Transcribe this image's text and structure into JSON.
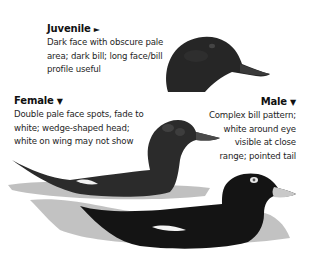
{
  "plate": {
    "captions": {
      "juvenile": {
        "title": "Juvenile",
        "arrow": "►",
        "lines": [
          "Dark face with obscure pale",
          "area; dark bill; long face/bill",
          "profile useful"
        ]
      },
      "female": {
        "title": "Female",
        "arrow": "▼",
        "lines": [
          "Double pale face spots, fade to",
          "white; wedge-shaped head;",
          "white on wing may not show"
        ]
      },
      "male": {
        "title": "Male",
        "arrow": "▼",
        "lines": [
          "Complex bill pattern;",
          "white around eye",
          "visible at close",
          "range; pointed tail"
        ]
      }
    },
    "illustrations": [
      {
        "id": "juvenile-head",
        "label": "juvenile head profile"
      },
      {
        "id": "female-bird",
        "label": "female swimming"
      },
      {
        "id": "male-bird",
        "label": "male swimming"
      }
    ],
    "colors": {
      "plumage_dark": "#1a1a1a",
      "plumage_female": "#2b2b2b",
      "water": "#9a9a9a",
      "wing_patch": "#f2f2f2",
      "bill_male": "#c9c9c9"
    }
  }
}
